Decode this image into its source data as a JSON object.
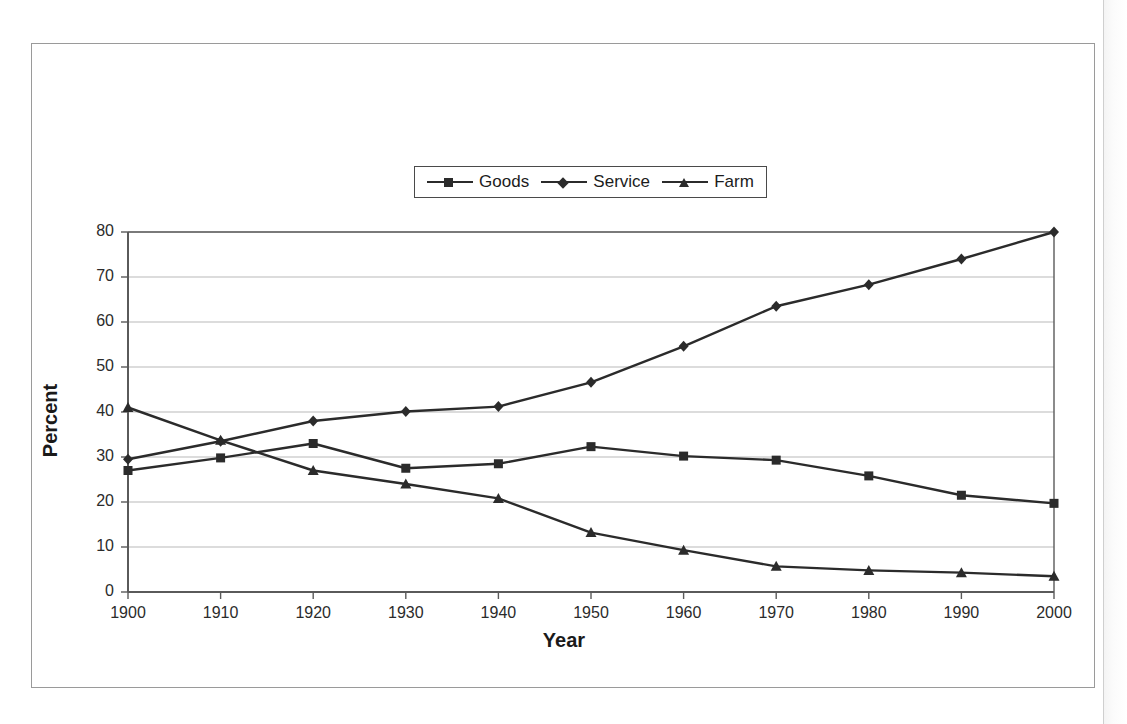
{
  "chart_data": {
    "type": "line",
    "title": "",
    "xlabel": "Year",
    "ylabel": "Percent",
    "x": [
      1900,
      1910,
      1920,
      1930,
      1940,
      1950,
      1960,
      1970,
      1980,
      1990,
      2000
    ],
    "xtick_labels": [
      "1900",
      "1910",
      "1920",
      "1930",
      "1940",
      "1950",
      "1960",
      "1970",
      "1980",
      "1990",
      "2000"
    ],
    "ytick_labels": [
      "0",
      "10",
      "20",
      "30",
      "40",
      "50",
      "60",
      "70",
      "80"
    ],
    "yticks": [
      0,
      10,
      20,
      30,
      40,
      50,
      60,
      70,
      80
    ],
    "xlim": [
      1900,
      2000
    ],
    "ylim": [
      0,
      80
    ],
    "grid": "horizontal",
    "legend_position": "top-center",
    "series": [
      {
        "name": "Goods",
        "marker": "square",
        "color": "#2b2b2b",
        "values": [
          27.0,
          29.8,
          33.0,
          27.5,
          28.5,
          32.3,
          30.2,
          29.3,
          25.8,
          21.5,
          19.7
        ]
      },
      {
        "name": "Service",
        "marker": "diamond",
        "color": "#2b2b2b",
        "values": [
          29.5,
          33.5,
          38.0,
          40.1,
          41.2,
          46.6,
          54.6,
          63.5,
          68.3,
          74.0,
          80.0
        ]
      },
      {
        "name": "Farm",
        "marker": "triangle",
        "color": "#2b2b2b",
        "values": [
          41.0,
          33.7,
          27.0,
          24.0,
          20.8,
          13.2,
          9.3,
          5.7,
          4.8,
          4.3,
          3.5
        ]
      }
    ]
  },
  "legend": {
    "items": [
      {
        "label": "Goods",
        "marker": "square-marker"
      },
      {
        "label": "Service",
        "marker": "diamond-marker"
      },
      {
        "label": "Farm",
        "marker": "triangle-marker"
      }
    ]
  },
  "axes": {
    "y_title": "Percent",
    "x_title": "Year"
  }
}
